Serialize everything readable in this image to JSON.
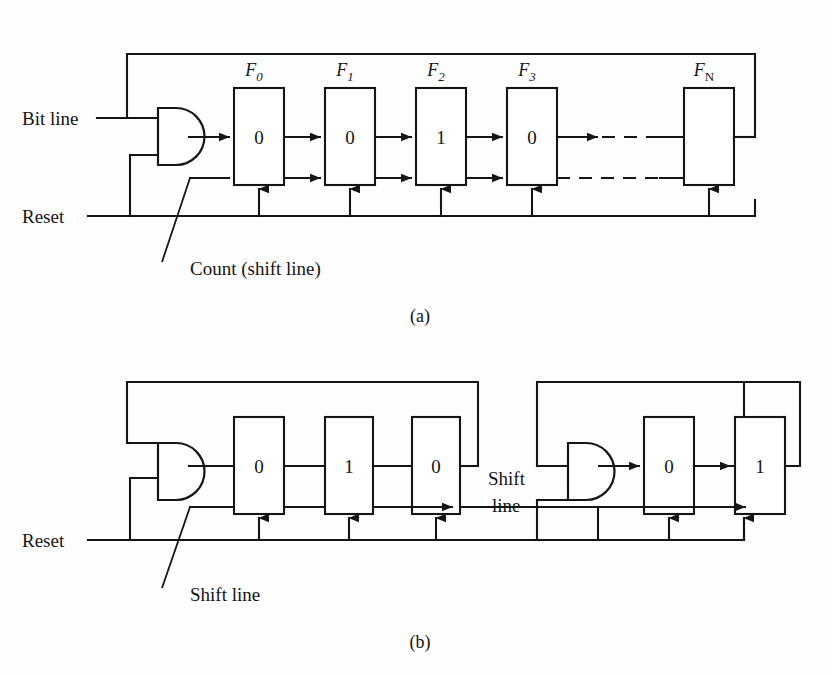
{
  "figure": {
    "caption_a": "(a)",
    "caption_b": "(b)"
  },
  "panel_a": {
    "inputs": {
      "bit_line": "Bit line",
      "reset": "Reset"
    },
    "annotation": "Count (shift line)",
    "gate_type": "and-gate",
    "flipflops": [
      {
        "name_base": "F",
        "name_sub": "0",
        "value": "0"
      },
      {
        "name_base": "F",
        "name_sub": "1",
        "value": "0"
      },
      {
        "name_base": "F",
        "name_sub": "2",
        "value": "1"
      },
      {
        "name_base": "F",
        "name_sub": "3",
        "value": "0"
      },
      {
        "name_base": "F",
        "name_sub": "N",
        "value": ""
      }
    ],
    "ellipsis_style": "dashed"
  },
  "panel_b": {
    "inputs": {
      "reset": "Reset"
    },
    "annotation": "Shift line",
    "mid_label_line1": "Shift",
    "mid_label_line2": "line",
    "group_left": {
      "gate_type": "and-gate",
      "cells": [
        "0",
        "1",
        "0"
      ]
    },
    "group_right": {
      "gate_type": "and-gate",
      "cells": [
        "0",
        "1"
      ]
    }
  },
  "colors": {
    "ink": "#151515",
    "paper": "#fefefe"
  }
}
